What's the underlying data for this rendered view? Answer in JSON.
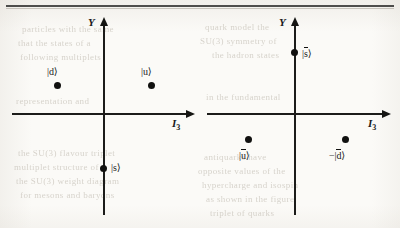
{
  "figure": {
    "type": "weight-diagram",
    "panels": [
      {
        "id": "quark-triplet",
        "axes": {
          "x_label": "I",
          "x_label_sub": "3",
          "y_label": "Y"
        },
        "points": [
          {
            "id": "d",
            "label_text": "|d⟩",
            "overline": false,
            "negated": false,
            "label_pos": "above",
            "x": -1,
            "y": 1
          },
          {
            "id": "u",
            "label_text": "|u⟩",
            "overline": false,
            "negated": false,
            "label_pos": "above",
            "x": 1,
            "y": 1
          },
          {
            "id": "s",
            "label_text": "|s⟩",
            "overline": false,
            "negated": false,
            "label_pos": "right",
            "x": 0,
            "y": -2
          }
        ]
      },
      {
        "id": "antiquark-triplet",
        "axes": {
          "x_label": "I",
          "x_label_sub": "3",
          "y_label": "Y"
        },
        "points": [
          {
            "id": "sbar",
            "label_text": "|s⟩",
            "base": "s",
            "overline": true,
            "negated": false,
            "label_pos": "right",
            "x": 0,
            "y": 2
          },
          {
            "id": "ubar",
            "label_text": "|u⟩",
            "base": "u",
            "overline": true,
            "negated": false,
            "label_pos": "below",
            "x": -1,
            "y": -1
          },
          {
            "id": "dbar",
            "label_text": "|d⟩",
            "base": "d",
            "overline": true,
            "negated": true,
            "label_pos": "below",
            "x": 1,
            "y": -1
          }
        ]
      }
    ]
  },
  "labels": {
    "panel1_d": "|d⟩",
    "panel1_u": "|u⟩",
    "panel1_s": "|s⟩",
    "panel2_sbar_pre": "|",
    "panel2_sbar_base": "s",
    "panel2_sbar_post": "⟩",
    "panel2_ubar_pre": "|",
    "panel2_ubar_base": "u",
    "panel2_ubar_post": "⟩",
    "panel2_dbar_sign": "−",
    "panel2_dbar_pre": "|",
    "panel2_dbar_base": "d",
    "panel2_dbar_post": "⟩",
    "axis_y": "Y",
    "axis_i": "I",
    "axis_i_sub": "3"
  },
  "ghost_text": {
    "lines": [
      {
        "text": "particles with the same",
        "x": 22,
        "y": 24
      },
      {
        "text": "that the states of a",
        "x": 18,
        "y": 38
      },
      {
        "text": "following multiplets",
        "x": 20,
        "y": 52
      },
      {
        "text": "quark model the",
        "x": 205,
        "y": 22
      },
      {
        "text": "SU(3) symmetry of",
        "x": 200,
        "y": 36
      },
      {
        "text": "the hadron states",
        "x": 212,
        "y": 50
      },
      {
        "text": "representation and",
        "x": 16,
        "y": 96
      },
      {
        "text": "in the fundamental",
        "x": 206,
        "y": 92
      },
      {
        "text": "the SU(3) flavour triplet",
        "x": 18,
        "y": 148
      },
      {
        "text": "multiplet structure of",
        "x": 14,
        "y": 162
      },
      {
        "text": "the SU(3) weight diagram",
        "x": 16,
        "y": 176
      },
      {
        "text": "for mesons and baryons",
        "x": 20,
        "y": 190
      },
      {
        "text": "antiquarks have",
        "x": 204,
        "y": 152
      },
      {
        "text": "opposite values of the",
        "x": 198,
        "y": 166
      },
      {
        "text": "hypercharge and isospin",
        "x": 202,
        "y": 180
      },
      {
        "text": "as shown in the figure",
        "x": 206,
        "y": 194
      },
      {
        "text": "triplet of quarks",
        "x": 210,
        "y": 208
      }
    ]
  },
  "colors": {
    "ink": "#111110",
    "paper": "#fbfaf7",
    "ghost": "#b9b3a8"
  }
}
